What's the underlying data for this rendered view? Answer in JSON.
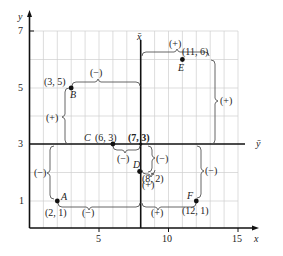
{
  "diagram": {
    "axes": {
      "x_label": "x",
      "y_label": "y",
      "xbar_label": "x̄",
      "ybar_label": "ȳ",
      "x_ticks": [
        "5",
        "10",
        "15"
      ],
      "y_ticks": [
        "1",
        "3",
        "5",
        "7"
      ]
    },
    "mean_point": {
      "label": "(7, 3)",
      "x": 7,
      "y": 3
    },
    "points": [
      {
        "name": "A",
        "coords": "(2, 1)",
        "x": 2,
        "y": 1,
        "dx_sign": "(−)",
        "dy_sign": "(−)"
      },
      {
        "name": "B",
        "coords": "(3, 5)",
        "x": 3,
        "y": 5,
        "dx_sign": "(−)",
        "dy_sign": "(+)"
      },
      {
        "name": "C",
        "coords": "(6, 3)",
        "x": 6,
        "y": 3,
        "dx_sign": "(−)",
        "dy_sign": ""
      },
      {
        "name": "D",
        "coords": "(8, 2)",
        "x": 8,
        "y": 2,
        "dx_sign": "(+)",
        "dy_sign": "(−)"
      },
      {
        "name": "E",
        "coords": "(11, 6)",
        "x": 11,
        "y": 6,
        "dx_sign": "(+)",
        "dy_sign": "(+)"
      },
      {
        "name": "F",
        "coords": "(12, 1)",
        "x": 12,
        "y": 1,
        "dx_sign": "(+)",
        "dy_sign": "(−)"
      }
    ],
    "colors": {
      "grid": "#c8c8c8",
      "axis": "#111111",
      "brace": "#555555",
      "point": "#111111"
    }
  }
}
